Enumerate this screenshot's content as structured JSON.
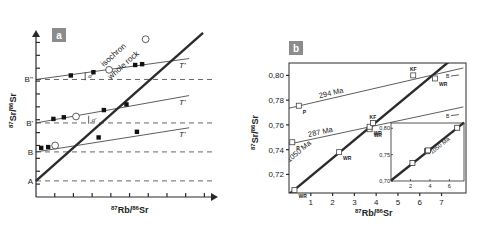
{
  "chart_data": [
    {
      "panel": "a",
      "type": "line",
      "title": "",
      "xlabel": "87Rb/86Sr",
      "ylabel": "87Sr/86Sr",
      "xlabel_parts": {
        "sup1": "87",
        "main1": "Rb/",
        "sup2": "86",
        "main2": "Sr"
      },
      "ylabel_parts": {
        "sup1": "87",
        "main1": "Sr/",
        "sup2": "86",
        "main2": "Sr"
      },
      "xlim": [
        0,
        10
      ],
      "ylim": [
        0,
        10
      ],
      "x_ticks": 9,
      "y_ticks": 12,
      "y_levels": [
        {
          "label": "A",
          "y": 1.0
        },
        {
          "label": "B",
          "y": 2.8
        },
        {
          "label": "B'",
          "y": 4.6
        },
        {
          "label": "B''",
          "y": 7.3
        }
      ],
      "whole_rock_isochron": {
        "label1": "isochron",
        "label2": "whole rock",
        "x": [
          0,
          9.6
        ],
        "y": [
          1.0,
          10.2
        ]
      },
      "whole_rock_points": [
        {
          "x": 1.1,
          "y": 3.2
        },
        {
          "x": 2.3,
          "y": 5.0
        },
        {
          "x": 4.2,
          "y": 7.9
        },
        {
          "x": 6.3,
          "y": 9.8
        }
      ],
      "mineral_isochrons": [
        {
          "label": "T'",
          "y0": 2.8,
          "x1": 8.8,
          "y1": 4.3,
          "points": [
            [
              0.3,
              3.05
            ],
            [
              0.7,
              3.1
            ],
            [
              3.6,
              3.7
            ],
            [
              5.8,
              4.05
            ]
          ]
        },
        {
          "label": "T'",
          "y0": 4.6,
          "x1": 8.8,
          "y1": 6.3,
          "points": [
            [
              1.0,
              4.85
            ],
            [
              1.6,
              4.95
            ],
            [
              3.9,
              5.4
            ],
            [
              5.2,
              5.75
            ]
          ]
        },
        {
          "label": "T'",
          "y0": 7.3,
          "x1": 8.8,
          "y1": 8.6,
          "points": [
            [
              2.0,
              7.55
            ],
            [
              3.3,
              7.75
            ],
            [
              5.7,
              8.2
            ],
            [
              6.1,
              8.25
            ]
          ]
        }
      ],
      "annotations": [
        {
          "text": "α'",
          "x": 3.0,
          "y": 7.5
        },
        {
          "text": "α'",
          "x": 3.2,
          "y": 4.8
        }
      ]
    },
    {
      "panel": "b",
      "type": "scatter",
      "title": "",
      "xlabel": "87Rb/86Sr",
      "ylabel": "87Sr/86Sr",
      "xlabel_parts": {
        "sup1": "87",
        "main1": "Rb/",
        "sup2": "86",
        "main2": "Sr"
      },
      "ylabel_parts": {
        "sup1": "87",
        "main1": "Sr/",
        "sup2": "86",
        "main2": "Sr"
      },
      "xlim": [
        0,
        8
      ],
      "ylim": [
        0.705,
        0.81
      ],
      "x_tick_labels": [
        "1",
        "2",
        "3",
        "4",
        "5",
        "6",
        "7"
      ],
      "x_ticks": [
        1,
        2,
        3,
        4,
        5,
        6,
        7
      ],
      "y_tick_labels": [
        "0,72",
        "0,74",
        "0,76",
        "0,78",
        "0,80"
      ],
      "y_ticks": [
        0.72,
        0.74,
        0.76,
        0.78,
        0.8
      ],
      "series": [
        {
          "name": "1050 Ma",
          "kind": "isochron",
          "x": [
            0,
            8
          ],
          "y": [
            0.704,
            0.8207
          ]
        },
        {
          "name": "294 Ma",
          "kind": "isochron",
          "x": [
            0,
            8
          ],
          "y": [
            0.7735,
            0.806
          ]
        },
        {
          "name": "287 Ma",
          "kind": "isochron",
          "x": [
            0,
            8
          ],
          "y": [
            0.7445,
            0.7745
          ]
        }
      ],
      "points": [
        {
          "x": 0.25,
          "y": 0.7075,
          "label": "WR"
        },
        {
          "x": 2.3,
          "y": 0.738,
          "label": "WR"
        },
        {
          "x": 3.7,
          "y": 0.7565,
          "label": "WR"
        },
        {
          "x": 3.7,
          "y": 0.7585,
          "label": "WR"
        },
        {
          "x": 3.85,
          "y": 0.7615,
          "label": "KF"
        },
        {
          "x": 6.7,
          "y": 0.7975,
          "label": "WR"
        },
        {
          "x": 5.7,
          "y": 0.8,
          "label": "KF"
        },
        {
          "x": 0.45,
          "y": 0.7755,
          "label": "P"
        },
        {
          "x": 0.15,
          "y": 0.746,
          "label": "P"
        }
      ],
      "line_end_labels": [
        {
          "text": "B",
          "x": 7.2,
          "y": 0.7995
        },
        {
          "text": "B",
          "x": 7.2,
          "y": 0.7675
        }
      ],
      "inset": {
        "xlim": [
          0,
          7.5
        ],
        "ylim": [
          0.7,
          0.81
        ],
        "x_tick_labels": [
          "2",
          "4",
          "6"
        ],
        "x_ticks": [
          2,
          4,
          6
        ],
        "y_tick_labels": [
          "0,70",
          "0,75",
          "0,80"
        ],
        "y_ticks": [
          0.7,
          0.75,
          0.8
        ],
        "line_label": "1050 Ma",
        "line": {
          "x": [
            0,
            7.5
          ],
          "y": [
            0.701,
            0.8108
          ]
        },
        "points": [
          [
            2.2,
            0.734
          ],
          [
            3.7,
            0.7565
          ],
          [
            3.8,
            0.758
          ],
          [
            6.8,
            0.801
          ]
        ]
      }
    }
  ],
  "panels": {
    "a": {
      "badge": "a"
    },
    "b": {
      "badge": "b"
    }
  },
  "colors": {
    "badge": "#8c8c8c",
    "line": "#2b2b2b",
    "axis": "#2a2a2a"
  }
}
